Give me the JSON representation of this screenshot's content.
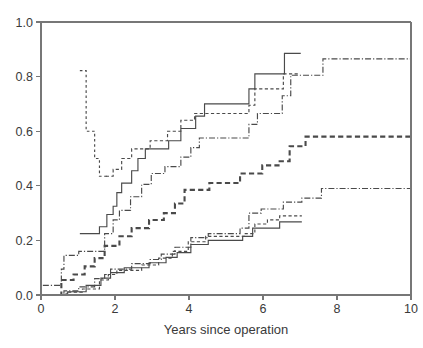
{
  "chart_data": {
    "type": "line",
    "title": "",
    "subtitle": "",
    "xlabel": "Years since operation",
    "ylabel": "",
    "xlim": [
      0,
      10
    ],
    "ylim": [
      0,
      1
    ],
    "grid": false,
    "legend": "none",
    "step_type": "post",
    "x_ticks": [
      0,
      2,
      4,
      6,
      8,
      10
    ],
    "x_tick_labels": [
      "0",
      "2",
      "4",
      "6",
      "8",
      "10"
    ],
    "y_ticks": [
      0.0,
      0.2,
      0.4,
      0.6,
      0.8,
      1.0
    ],
    "y_tick_labels": [
      "0.0",
      "0.2",
      "0.4",
      "0.6",
      "0.8",
      "1.0"
    ],
    "series": [
      {
        "name": "upper-solid",
        "style": "solid",
        "values": [
          [
            1.05,
            0.225
          ],
          [
            1.58,
            0.225
          ],
          [
            1.58,
            0.25
          ],
          [
            1.78,
            0.25
          ],
          [
            1.78,
            0.295
          ],
          [
            1.95,
            0.295
          ],
          [
            1.95,
            0.325
          ],
          [
            2.05,
            0.325
          ],
          [
            2.05,
            0.375
          ],
          [
            2.18,
            0.375
          ],
          [
            2.18,
            0.41
          ],
          [
            2.45,
            0.41
          ],
          [
            2.45,
            0.455
          ],
          [
            2.62,
            0.455
          ],
          [
            2.62,
            0.5
          ],
          [
            2.82,
            0.5
          ],
          [
            2.82,
            0.535
          ],
          [
            3.45,
            0.535
          ],
          [
            3.45,
            0.565
          ],
          [
            3.78,
            0.565
          ],
          [
            3.78,
            0.61
          ],
          [
            4.18,
            0.61
          ],
          [
            4.18,
            0.655
          ],
          [
            4.42,
            0.655
          ],
          [
            4.42,
            0.7
          ],
          [
            5.62,
            0.7
          ],
          [
            5.62,
            0.755
          ],
          [
            5.78,
            0.755
          ],
          [
            5.78,
            0.81
          ],
          [
            6.58,
            0.81
          ],
          [
            6.58,
            0.885
          ],
          [
            7.02,
            0.885
          ]
        ]
      },
      {
        "name": "upper-dashed-fine",
        "style": "dashed-fine",
        "values": [
          [
            1.75,
            0.435
          ],
          [
            1.95,
            0.435
          ],
          [
            1.95,
            0.46
          ],
          [
            2.18,
            0.46
          ],
          [
            2.18,
            0.5
          ],
          [
            2.45,
            0.5
          ],
          [
            2.45,
            0.535
          ],
          [
            2.95,
            0.535
          ],
          [
            2.95,
            0.565
          ],
          [
            3.42,
            0.565
          ],
          [
            3.42,
            0.6
          ],
          [
            3.78,
            0.6
          ],
          [
            3.78,
            0.64
          ],
          [
            4.15,
            0.64
          ],
          [
            4.15,
            0.665
          ],
          [
            5.62,
            0.665
          ],
          [
            5.62,
            0.695
          ],
          [
            5.78,
            0.695
          ],
          [
            5.78,
            0.755
          ],
          [
            6.55,
            0.755
          ],
          [
            6.55,
            0.81
          ],
          [
            6.95,
            0.81
          ]
        ]
      },
      {
        "name": "upper-dashdot",
        "style": "dashdot",
        "values": [
          [
            0.05,
            0.035
          ],
          [
            0.55,
            0.035
          ],
          [
            0.55,
            0.095
          ],
          [
            0.62,
            0.095
          ],
          [
            0.62,
            0.145
          ],
          [
            1.02,
            0.145
          ],
          [
            1.02,
            0.16
          ],
          [
            1.72,
            0.16
          ],
          [
            1.72,
            0.225
          ],
          [
            1.95,
            0.225
          ],
          [
            1.95,
            0.275
          ],
          [
            2.12,
            0.275
          ],
          [
            2.12,
            0.31
          ],
          [
            2.42,
            0.31
          ],
          [
            2.42,
            0.36
          ],
          [
            2.72,
            0.36
          ],
          [
            2.72,
            0.405
          ],
          [
            2.98,
            0.405
          ],
          [
            2.98,
            0.445
          ],
          [
            3.35,
            0.445
          ],
          [
            3.35,
            0.47
          ],
          [
            3.78,
            0.47
          ],
          [
            3.78,
            0.505
          ],
          [
            4.05,
            0.505
          ],
          [
            4.05,
            0.54
          ],
          [
            4.28,
            0.54
          ],
          [
            4.28,
            0.575
          ],
          [
            5.62,
            0.575
          ],
          [
            5.62,
            0.625
          ],
          [
            5.85,
            0.625
          ],
          [
            5.85,
            0.665
          ],
          [
            6.52,
            0.665
          ],
          [
            6.52,
            0.73
          ],
          [
            6.75,
            0.73
          ],
          [
            6.75,
            0.805
          ],
          [
            7.62,
            0.805
          ],
          [
            7.62,
            0.865
          ],
          [
            10.0,
            0.865
          ]
        ]
      },
      {
        "name": "mid-dashed-thick",
        "style": "dashed-thick",
        "values": [
          [
            0.05,
            0.0
          ],
          [
            0.55,
            0.0
          ],
          [
            0.55,
            0.055
          ],
          [
            0.88,
            0.055
          ],
          [
            0.88,
            0.075
          ],
          [
            1.18,
            0.075
          ],
          [
            1.18,
            0.105
          ],
          [
            1.45,
            0.105
          ],
          [
            1.45,
            0.135
          ],
          [
            1.72,
            0.135
          ],
          [
            1.72,
            0.18
          ],
          [
            2.12,
            0.18
          ],
          [
            2.12,
            0.215
          ],
          [
            2.45,
            0.215
          ],
          [
            2.45,
            0.245
          ],
          [
            2.92,
            0.245
          ],
          [
            2.92,
            0.275
          ],
          [
            3.32,
            0.275
          ],
          [
            3.32,
            0.3
          ],
          [
            3.62,
            0.3
          ],
          [
            3.62,
            0.335
          ],
          [
            3.88,
            0.335
          ],
          [
            3.88,
            0.385
          ],
          [
            4.55,
            0.385
          ],
          [
            4.55,
            0.41
          ],
          [
            5.38,
            0.41
          ],
          [
            5.38,
            0.445
          ],
          [
            5.98,
            0.445
          ],
          [
            5.98,
            0.475
          ],
          [
            6.45,
            0.475
          ],
          [
            6.45,
            0.49
          ],
          [
            6.72,
            0.49
          ],
          [
            6.72,
            0.545
          ],
          [
            7.15,
            0.545
          ],
          [
            7.15,
            0.58
          ],
          [
            10.0,
            0.58
          ]
        ]
      },
      {
        "name": "lower-dashdot",
        "style": "dashdot",
        "values": [
          [
            0.05,
            0.0
          ],
          [
            0.62,
            0.0
          ],
          [
            0.62,
            0.015
          ],
          [
            1.02,
            0.015
          ],
          [
            1.02,
            0.03
          ],
          [
            1.45,
            0.03
          ],
          [
            1.45,
            0.06
          ],
          [
            1.72,
            0.06
          ],
          [
            1.72,
            0.075
          ],
          [
            1.88,
            0.075
          ],
          [
            1.88,
            0.095
          ],
          [
            2.45,
            0.095
          ],
          [
            2.45,
            0.115
          ],
          [
            2.95,
            0.115
          ],
          [
            2.95,
            0.13
          ],
          [
            3.25,
            0.13
          ],
          [
            3.25,
            0.15
          ],
          [
            3.62,
            0.15
          ],
          [
            3.62,
            0.175
          ],
          [
            4.05,
            0.175
          ],
          [
            4.05,
            0.21
          ],
          [
            4.52,
            0.21
          ],
          [
            4.52,
            0.225
          ],
          [
            5.38,
            0.225
          ],
          [
            5.38,
            0.245
          ],
          [
            5.62,
            0.245
          ],
          [
            5.62,
            0.3
          ],
          [
            5.95,
            0.3
          ],
          [
            5.95,
            0.315
          ],
          [
            6.55,
            0.315
          ],
          [
            6.55,
            0.34
          ],
          [
            7.05,
            0.34
          ],
          [
            7.05,
            0.355
          ],
          [
            7.58,
            0.355
          ],
          [
            7.58,
            0.39
          ],
          [
            10.0,
            0.39
          ]
        ]
      },
      {
        "name": "lower-dashed-fine",
        "style": "dashed-fine",
        "values": [
          [
            0.05,
            0.0
          ],
          [
            0.68,
            0.0
          ],
          [
            0.68,
            0.01
          ],
          [
            1.12,
            0.01
          ],
          [
            1.12,
            0.022
          ],
          [
            1.58,
            0.022
          ],
          [
            1.58,
            0.055
          ],
          [
            1.82,
            0.055
          ],
          [
            1.82,
            0.075
          ],
          [
            2.05,
            0.075
          ],
          [
            2.05,
            0.09
          ],
          [
            2.72,
            0.09
          ],
          [
            2.72,
            0.11
          ],
          [
            3.18,
            0.11
          ],
          [
            3.18,
            0.135
          ],
          [
            3.55,
            0.135
          ],
          [
            3.55,
            0.16
          ],
          [
            3.98,
            0.16
          ],
          [
            3.98,
            0.195
          ],
          [
            4.45,
            0.195
          ],
          [
            4.45,
            0.215
          ],
          [
            5.52,
            0.215
          ],
          [
            5.52,
            0.225
          ],
          [
            5.78,
            0.225
          ],
          [
            5.78,
            0.26
          ],
          [
            6.12,
            0.26
          ],
          [
            6.12,
            0.275
          ],
          [
            6.45,
            0.275
          ],
          [
            6.45,
            0.29
          ],
          [
            7.05,
            0.29
          ]
        ]
      },
      {
        "name": "lower-solid",
        "style": "solid",
        "values": [
          [
            0.05,
            0.0
          ],
          [
            0.72,
            0.0
          ],
          [
            0.72,
            0.012
          ],
          [
            1.22,
            0.012
          ],
          [
            1.22,
            0.035
          ],
          [
            1.62,
            0.035
          ],
          [
            1.62,
            0.062
          ],
          [
            1.88,
            0.062
          ],
          [
            1.88,
            0.082
          ],
          [
            2.25,
            0.082
          ],
          [
            2.25,
            0.1
          ],
          [
            2.92,
            0.1
          ],
          [
            2.92,
            0.118
          ],
          [
            3.38,
            0.118
          ],
          [
            3.38,
            0.138
          ],
          [
            3.68,
            0.138
          ],
          [
            3.68,
            0.155
          ],
          [
            4.05,
            0.155
          ],
          [
            4.05,
            0.185
          ],
          [
            4.52,
            0.185
          ],
          [
            4.52,
            0.2
          ],
          [
            5.45,
            0.2
          ],
          [
            5.45,
            0.215
          ],
          [
            5.72,
            0.215
          ],
          [
            5.72,
            0.245
          ],
          [
            6.45,
            0.245
          ],
          [
            6.45,
            0.268
          ],
          [
            7.05,
            0.268
          ]
        ]
      },
      {
        "name": "descending-dashed-band",
        "style": "dashed-drop",
        "values": [
          [
            1.05,
            0.822
          ],
          [
            1.22,
            0.822
          ],
          [
            1.22,
            0.6
          ],
          [
            1.45,
            0.6
          ],
          [
            1.45,
            0.5
          ],
          [
            1.58,
            0.5
          ],
          [
            1.58,
            0.435
          ],
          [
            1.8,
            0.435
          ]
        ]
      }
    ]
  },
  "axes": {
    "x_title": "Years since operation"
  }
}
